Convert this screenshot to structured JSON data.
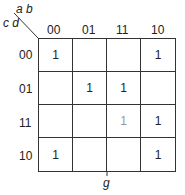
{
  "kmap": {
    "row_var": "c d",
    "col_var": "a b",
    "col_labels": [
      "00",
      "01",
      "11",
      "10"
    ],
    "row_labels": [
      "00",
      "01",
      "11",
      "10"
    ],
    "cells": [
      [
        "1",
        "",
        "",
        "1"
      ],
      [
        "",
        "1",
        "1",
        ""
      ],
      [
        "",
        "",
        "1",
        "1"
      ],
      [
        "1",
        "",
        "",
        "1"
      ]
    ],
    "function_label": "g"
  }
}
